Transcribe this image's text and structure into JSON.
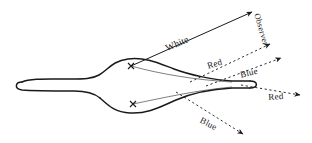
{
  "figure": {
    "background_color": "#ffffff",
    "ink_color": "#1a1a1a",
    "width": 312,
    "height": 143,
    "body": {
      "name": "prism-body",
      "description": "elongated biconvex spindle shape with thin tube arms left and right"
    },
    "sources": [
      {
        "name": "upper-ray-origin",
        "x": 131,
        "y": 66
      },
      {
        "name": "lower-ray-origin",
        "x": 133,
        "y": 104
      }
    ],
    "rays": [
      {
        "id": "white",
        "label": "White",
        "style": "solid",
        "from": {
          "x": 131,
          "y": 66
        },
        "to": {
          "x": 252,
          "y": 12
        }
      },
      {
        "id": "observer",
        "label": "Observer",
        "style": "none",
        "from": {
          "x": 258,
          "y": 14
        },
        "to": {
          "x": 284,
          "y": 52
        }
      },
      {
        "id": "red-upper",
        "label": "Red",
        "style": "dashed",
        "from": {
          "x": 190,
          "y": 82
        },
        "to": {
          "x": 270,
          "y": 44
        }
      },
      {
        "id": "blue-upper",
        "label": "Blue",
        "style": "dashed",
        "from": {
          "x": 206,
          "y": 86
        },
        "to": {
          "x": 280,
          "y": 58
        }
      },
      {
        "id": "red-lower",
        "label": "Red",
        "style": "dashed",
        "from": {
          "x": 241,
          "y": 85
        },
        "to": {
          "x": 299,
          "y": 94
        }
      },
      {
        "id": "blue-lower",
        "label": "Blue",
        "style": "dashed",
        "from": {
          "x": 176,
          "y": 92
        },
        "to": {
          "x": 243,
          "y": 134
        }
      }
    ],
    "labels": {
      "white": "White",
      "observer": "Observer",
      "red_upper": "Red",
      "blue_upper": "Blue",
      "red_lower": "Red",
      "blue_lower": "Blue"
    }
  }
}
